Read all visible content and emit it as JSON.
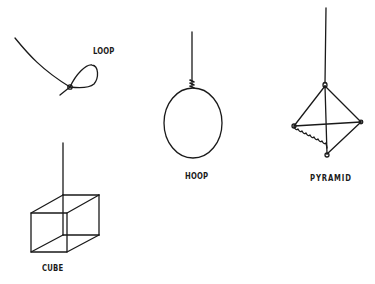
{
  "figure": {
    "stroke_color": "#1a1a1a",
    "background": "#ffffff",
    "shapes": [
      {
        "id": "loop",
        "label": "LOOP"
      },
      {
        "id": "hoop",
        "label": "HOOP"
      },
      {
        "id": "pyramid",
        "label": "PYRAMID"
      },
      {
        "id": "cube",
        "label": "CUBE"
      }
    ]
  },
  "labels": {
    "loop": "LOOP",
    "hoop": "HOOP",
    "pyramid": "PYRAMID",
    "cube": "CUBE"
  }
}
